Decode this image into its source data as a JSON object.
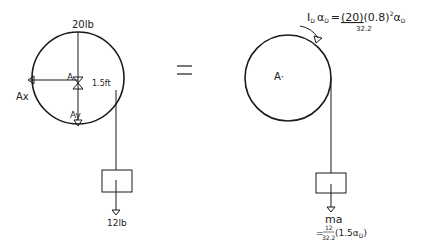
{
  "colors": {
    "ink": "#1a1a1a",
    "background": "#ffffff"
  },
  "fbd": {
    "weight_label": "20lb",
    "pin_label": "A",
    "ax_label": "Ax",
    "ay_label": "Ay",
    "radius_label": "1.5ft",
    "block_weight_label": "12lb"
  },
  "equals_sign": "=",
  "kinetic": {
    "center_label": "A·",
    "moment_lhs": "I",
    "moment_lhs_sub": "D",
    "alpha": "α",
    "alpha_sub": "D",
    "equals": "=",
    "mass_num": "(20)",
    "mass_den": "32.2",
    "radius_term": "(0.8)",
    "exponent": "2",
    "ma_label": "ma",
    "ma_eq": "=",
    "ma_num": "12",
    "ma_den": "32.2",
    "ma_term": "(1.5α",
    "ma_term_sub": "D",
    "ma_close": ")"
  }
}
